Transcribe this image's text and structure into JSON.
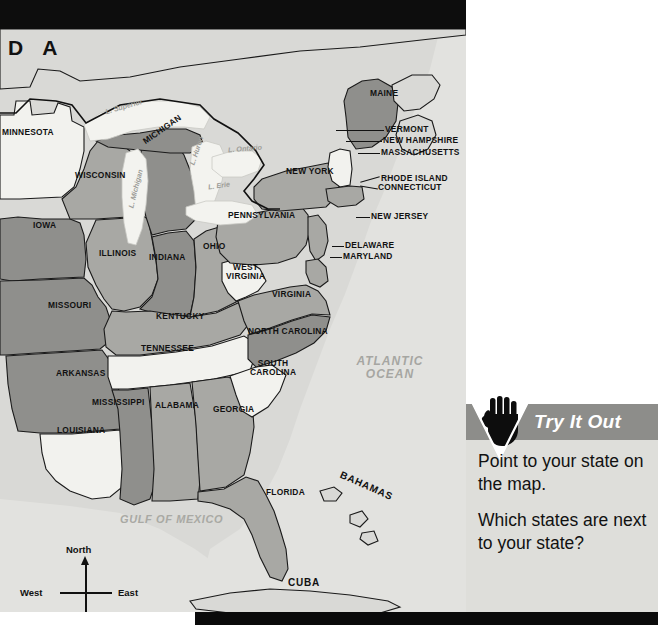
{
  "page": {
    "corner_code": "D A",
    "background_color": "#ffffff",
    "map_background_color": "#d9d9d6",
    "bar_color": "#0d0d0d"
  },
  "map": {
    "title_none": "",
    "land_colors": {
      "dark_shade": "#8f8f8c",
      "mid_shade": "#a8a8a4",
      "light_shade": "#f2f2ee",
      "ocean": "#e2e2df",
      "lake": "#f3f3ef"
    },
    "states": [
      {
        "name": "MINNESOTA",
        "x": 2,
        "y": 128,
        "shade": "light"
      },
      {
        "name": "WISCONSIN",
        "x": 75,
        "y": 171,
        "shade": "mid"
      },
      {
        "name": "MICHIGAN",
        "x": 143,
        "y": 125,
        "shade": "dark",
        "rotate": -35
      },
      {
        "name": "IOWA",
        "x": 33,
        "y": 221,
        "shade": "dark"
      },
      {
        "name": "ILLINOIS",
        "x": 99,
        "y": 249,
        "shade": "mid"
      },
      {
        "name": "INDIANA",
        "x": 149,
        "y": 253,
        "shade": "dark"
      },
      {
        "name": "OHIO",
        "x": 202,
        "y": 242,
        "shade": "mid"
      },
      {
        "name": "MISSOURI",
        "x": 48,
        "y": 301,
        "shade": "dark"
      },
      {
        "name": "KENTUCKY",
        "x": 156,
        "y": 312,
        "shade": "mid"
      },
      {
        "name": "TENNESSEE",
        "x": 141,
        "y": 344,
        "shade": "light"
      },
      {
        "name": "ARKANSAS",
        "x": 56,
        "y": 369,
        "shade": "dark"
      },
      {
        "name": "MISSISSIPPI",
        "x": 96,
        "y": 398,
        "shade": "dark"
      },
      {
        "name": "ALABAMA",
        "x": 155,
        "y": 401,
        "shade": "mid"
      },
      {
        "name": "GEORGIA",
        "x": 213,
        "y": 405,
        "shade": "mid"
      },
      {
        "name": "LOUISIANA",
        "x": 57,
        "y": 426,
        "shade": "light"
      },
      {
        "name": "FLORIDA",
        "x": 266,
        "y": 488,
        "shade": "mid"
      },
      {
        "name": "SOUTH\nCAROLINA",
        "x": 253,
        "y": 359,
        "shade": "light"
      },
      {
        "name": "NORTH CAROLINA",
        "x": 248,
        "y": 327,
        "shade": "dark"
      },
      {
        "name": "VIRGINIA",
        "x": 272,
        "y": 290,
        "shade": "mid"
      },
      {
        "name": "WEST\nVIRGINIA",
        "x": 230,
        "y": 263,
        "shade": "light"
      },
      {
        "name": "PENNSYLVANIA",
        "x": 228,
        "y": 211,
        "shade": "mid"
      },
      {
        "name": "NEW YORK",
        "x": 286,
        "y": 167,
        "shade": "mid"
      },
      {
        "name": "MAINE",
        "x": 370,
        "y": 89,
        "shade": "dark"
      }
    ],
    "callout_states": [
      {
        "name": "VERMONT",
        "x": 387,
        "y": 127
      },
      {
        "name": "NEW HAMPSHIRE",
        "x": 384,
        "y": 138
      },
      {
        "name": "MASSACHUSETTS",
        "x": 382,
        "y": 150
      },
      {
        "name": "RHODE ISLAND",
        "x": 382,
        "y": 176
      },
      {
        "name": "CONNECTICUT",
        "x": 379,
        "y": 185
      },
      {
        "name": "NEW JERSEY",
        "x": 372,
        "y": 214
      },
      {
        "name": "DELAWARE",
        "x": 345,
        "y": 243
      },
      {
        "name": "MARYLAND",
        "x": 343,
        "y": 254
      }
    ],
    "lakes": [
      {
        "name": "L. Superior",
        "x": 110,
        "y": 103,
        "rotate": -16
      },
      {
        "name": "L. Michigan",
        "x": 135,
        "y": 185,
        "rotate": -76
      },
      {
        "name": "L. Huron",
        "x": 192,
        "y": 147,
        "rotate": -72
      },
      {
        "name": "L. Ontario",
        "x": 232,
        "y": 145,
        "rotate": -5
      },
      {
        "name": "L. Erie",
        "x": 212,
        "y": 182,
        "rotate": -8
      }
    ],
    "water_labels": [
      {
        "name": "ATLANTIC\nOCEAN",
        "x": 352,
        "y": 355
      },
      {
        "name": "GULF OF MEXICO",
        "x": 125,
        "y": 514
      }
    ],
    "islands": [
      {
        "name": "BAHAMAS",
        "x": 342,
        "y": 481,
        "rotate": 24
      },
      {
        "name": "CUBA",
        "x": 290,
        "y": 578,
        "rotate": 0
      }
    ],
    "compass": {
      "north": "North",
      "south": "South",
      "east": "East",
      "west": "West"
    }
  },
  "try_it_out": {
    "icon": "pointing-hand-icon",
    "title": "Try It Out",
    "header_color": "#8d8d8a",
    "panel_color": "#dededa",
    "paragraphs": [
      "Point to your state on the map.",
      "Which states are next to your state?"
    ]
  }
}
